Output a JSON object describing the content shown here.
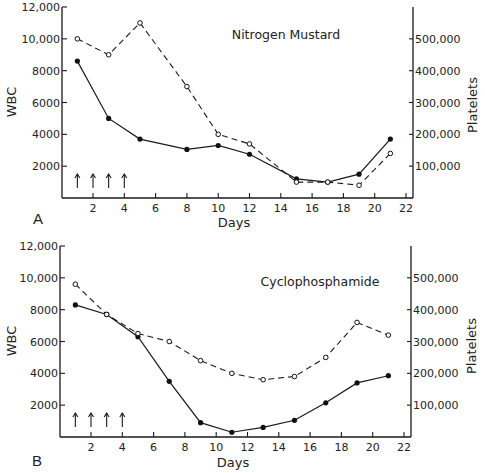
{
  "chart_data": [
    {
      "type": "line",
      "panel_label": "A",
      "title": "Nitrogen Mustard",
      "xlabel": "Days",
      "ylabel": "WBC",
      "y2label": "Platelets",
      "xlim": [
        0,
        22
      ],
      "ylim": [
        0,
        12000
      ],
      "y2lim": [
        0,
        600000
      ],
      "x_ticks": [
        2,
        4,
        6,
        8,
        10,
        12,
        14,
        16,
        18,
        20,
        22
      ],
      "x_tick_labels": [
        "2",
        "4",
        "6",
        "8",
        "10",
        "12",
        "14",
        "16",
        "18",
        "20",
        "22"
      ],
      "y_ticks": [
        2000,
        4000,
        6000,
        8000,
        10000,
        12000
      ],
      "y_tick_labels": [
        "2000",
        "4000",
        "6000",
        "8000",
        "10,000",
        "12,000"
      ],
      "y2_ticks": [
        100000,
        200000,
        300000,
        400000,
        500000
      ],
      "y2_tick_labels": [
        "100,000",
        "200,000",
        "300,000",
        "400,000",
        "500,000"
      ],
      "dose_arrows_days": [
        1,
        2,
        3,
        4
      ],
      "grid": false,
      "series": [
        {
          "name": "WBC",
          "axis": "left",
          "style": "solid-filled-dots",
          "x": [
            1,
            3,
            5,
            8,
            10,
            12,
            15,
            17,
            19,
            21
          ],
          "values": [
            8600,
            5000,
            3700,
            3050,
            3300,
            2750,
            1200,
            1000,
            1500,
            3700
          ]
        },
        {
          "name": "Platelets",
          "axis": "right",
          "style": "dashed-open-dots",
          "x": [
            1,
            3,
            5,
            8,
            10,
            12,
            15,
            17,
            19,
            21
          ],
          "values": [
            500000,
            450000,
            550000,
            350000,
            200000,
            170000,
            50000,
            50000,
            40000,
            140000
          ]
        }
      ]
    },
    {
      "type": "line",
      "panel_label": "B",
      "title": "Cyclophosphamide",
      "xlabel": "Days",
      "ylabel": "WBC",
      "y2label": "Platelets",
      "xlim": [
        0,
        22
      ],
      "ylim": [
        0,
        12000
      ],
      "y2lim": [
        0,
        600000
      ],
      "x_ticks": [
        2,
        4,
        6,
        8,
        10,
        12,
        14,
        16,
        18,
        20,
        22
      ],
      "x_tick_labels": [
        "2",
        "4",
        "6",
        "8",
        "10",
        "12",
        "14",
        "16",
        "18",
        "20",
        "22"
      ],
      "y_ticks": [
        2000,
        4000,
        6000,
        8000,
        10000,
        12000
      ],
      "y_tick_labels": [
        "2000",
        "4000",
        "6000",
        "8000",
        "10,000",
        "12,000"
      ],
      "y2_ticks": [
        100000,
        200000,
        300000,
        400000,
        500000
      ],
      "y2_tick_labels": [
        "100,000",
        "200,000",
        "300,000",
        "400,000",
        "500,000"
      ],
      "dose_arrows_days": [
        1,
        2,
        3,
        4
      ],
      "grid": false,
      "series": [
        {
          "name": "WBC",
          "axis": "left",
          "style": "solid-filled-dots",
          "x": [
            1,
            3,
            5,
            7,
            9,
            11,
            13,
            15,
            17,
            19,
            21
          ],
          "values": [
            8300,
            7700,
            6300,
            3500,
            900,
            300,
            600,
            1050,
            2150,
            3400,
            3850
          ]
        },
        {
          "name": "Platelets",
          "axis": "right",
          "style": "dashed-open-dots",
          "x": [
            1,
            3,
            5,
            7,
            9,
            11,
            13,
            15,
            17,
            19,
            21
          ],
          "values": [
            480000,
            385000,
            325000,
            300000,
            240000,
            200000,
            180000,
            190000,
            250000,
            360000,
            320000
          ]
        }
      ]
    }
  ]
}
